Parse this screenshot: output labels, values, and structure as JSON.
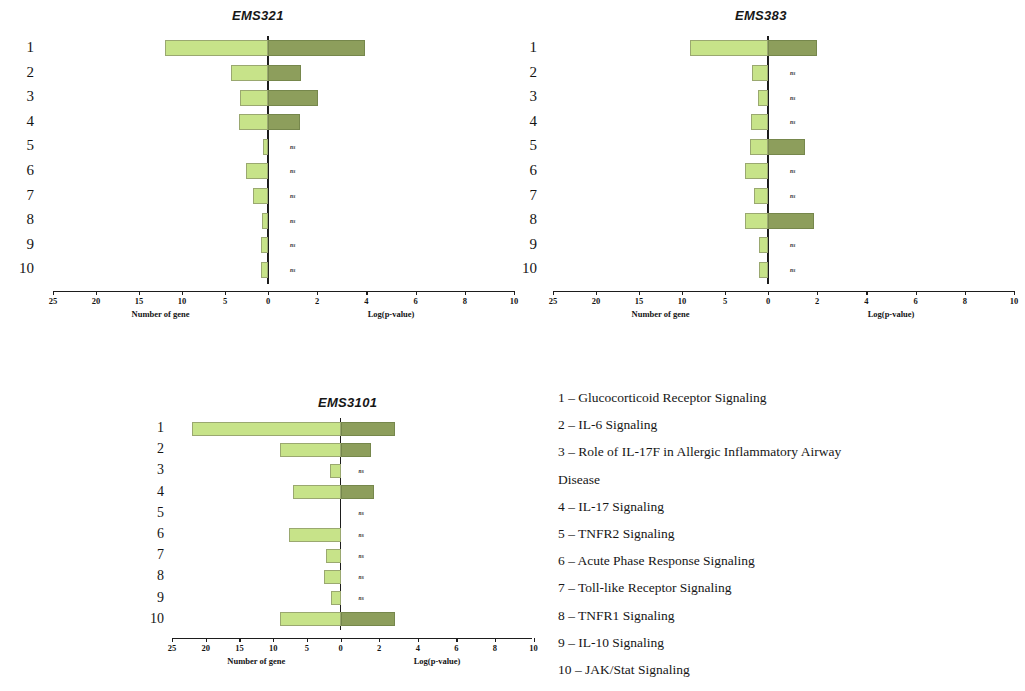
{
  "figure": {
    "background": "#ffffff",
    "bar_color_left": "#c7e389",
    "bar_color_right": "#8d9e5c",
    "ns_marker": "ns"
  },
  "axis": {
    "left_caption": "Number of gene",
    "right_caption": "Log(p-value)",
    "left_ticks": [
      "25",
      "20",
      "15",
      "10",
      "5",
      "0"
    ],
    "right_ticks": [
      "0",
      "2",
      "4",
      "6",
      "8",
      "10"
    ],
    "left_max": 25,
    "right_max": 10
  },
  "row_labels": [
    "1",
    "2",
    "3",
    "4",
    "5",
    "6",
    "7",
    "8",
    "9",
    "10"
  ],
  "legend": {
    "items": [
      "1 – Glucocorticoid Receptor Signaling",
      "2 – IL-6 Signaling",
      "3 – Role of IL-17F in Allergic Inflammatory Airway",
      "Disease",
      "4 – IL-17 Signaling",
      "5 – TNFR2 Signaling",
      "6 – Acute Phase Response Signaling",
      "7 – Toll-like Receptor Signaling",
      "8 – TNFR1 Signaling",
      "9 – IL-10 Signaling",
      "10 – JAK/Stat Signaling"
    ]
  },
  "chart_data": [
    {
      "type": "bar",
      "title": "EMS321",
      "orientation": "horizontal-diverging",
      "categories": [
        "1",
        "2",
        "3",
        "4",
        "5",
        "6",
        "7",
        "8",
        "9",
        "10"
      ],
      "xlabel_left": "Number of gene",
      "xlabel_right": "Log(p-value)",
      "xlim_left": [
        25,
        0
      ],
      "xlim_right": [
        0,
        10
      ],
      "grid": false,
      "legend": "none",
      "series": [
        {
          "name": "Number of gene",
          "side": "left",
          "color": "#c7e389",
          "values": [
            12.0,
            4.3,
            3.3,
            3.4,
            0.6,
            2.6,
            1.8,
            0.7,
            0.8,
            0.8
          ]
        },
        {
          "name": "Log(p-value)",
          "side": "right",
          "color": "#8d9e5c",
          "values": [
            3.95,
            1.35,
            2.05,
            1.3,
            0,
            0,
            0,
            0,
            0,
            0
          ]
        }
      ],
      "significance": [
        "",
        "",
        "",
        "",
        "ns",
        "ns",
        "ns",
        "ns",
        "ns",
        "ns"
      ]
    },
    {
      "type": "bar",
      "title": "EMS383",
      "orientation": "horizontal-diverging",
      "categories": [
        "1",
        "2",
        "3",
        "4",
        "5",
        "6",
        "7",
        "8",
        "9",
        "10"
      ],
      "xlabel_left": "Number of gene",
      "xlabel_right": "Log(p-value)",
      "xlim_left": [
        25,
        0
      ],
      "xlim_right": [
        0,
        10
      ],
      "grid": false,
      "legend": "none",
      "series": [
        {
          "name": "Number of gene",
          "side": "left",
          "color": "#c7e389",
          "values": [
            9.1,
            1.9,
            1.2,
            2.0,
            2.1,
            2.7,
            1.6,
            2.7,
            1.0,
            1.0
          ]
        },
        {
          "name": "Log(p-value)",
          "side": "right",
          "color": "#8d9e5c",
          "values": [
            2.0,
            0,
            0,
            0,
            1.5,
            0,
            0,
            1.85,
            0,
            0
          ]
        }
      ],
      "significance": [
        "",
        "ns",
        "ns",
        "ns",
        "",
        "ns",
        "ns",
        "",
        "ns",
        "ns"
      ]
    },
    {
      "type": "bar",
      "title": "EMS3101",
      "orientation": "horizontal-diverging",
      "categories": [
        "1",
        "2",
        "3",
        "4",
        "5",
        "6",
        "7",
        "8",
        "9",
        "10"
      ],
      "xlabel_left": "Number of gene",
      "xlabel_right": "Log(p-value)",
      "xlim_left": [
        25,
        0
      ],
      "xlim_right": [
        0,
        10
      ],
      "grid": false,
      "legend": "none",
      "series": [
        {
          "name": "Number of gene",
          "side": "left",
          "color": "#c7e389",
          "values": [
            22.0,
            9.0,
            1.6,
            7.0,
            0,
            7.6,
            2.2,
            2.4,
            1.4,
            9.0
          ]
        },
        {
          "name": "Log(p-value)",
          "side": "right",
          "color": "#8d9e5c",
          "values": [
            2.8,
            1.6,
            0,
            1.75,
            0,
            0,
            0,
            0,
            0,
            2.8
          ]
        }
      ],
      "significance": [
        "",
        "",
        "ns",
        "",
        "ns",
        "ns",
        "ns",
        "ns",
        "ns",
        ""
      ]
    }
  ]
}
